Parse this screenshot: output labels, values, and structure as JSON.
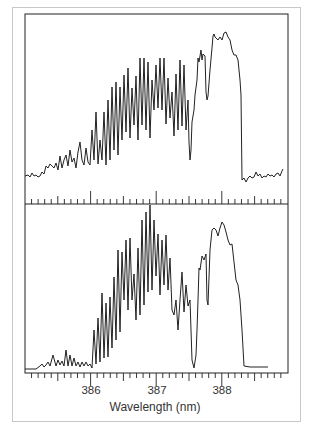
{
  "chart_data": {
    "type": "line",
    "title": "",
    "xlabel": "Wavelength (nm)",
    "ylabel": "",
    "xlim": [
      385.0,
      389.0
    ],
    "x_ticks_major": [
      386,
      387,
      388
    ],
    "x_tick_labels": [
      "386",
      "387",
      "388"
    ],
    "minor_tick_step": 0.1,
    "grid": false,
    "legend": null,
    "panels": [
      {
        "name": "top-spectrum",
        "description": "Measured/noisy emission spectrum with rotational band structure",
        "x": [
          385.0,
          385.3,
          385.5,
          385.7,
          385.9,
          386.0,
          386.1,
          386.2,
          386.3,
          386.4,
          386.5,
          386.6,
          386.7,
          386.8,
          386.9,
          387.0,
          387.1,
          387.2,
          387.3,
          387.4,
          387.5,
          387.6,
          387.7,
          387.8,
          387.9,
          388.0,
          388.1,
          388.2,
          388.3,
          388.4,
          388.5,
          388.7,
          388.9
        ],
        "y": [
          0.1,
          0.12,
          0.18,
          0.22,
          0.28,
          0.4,
          0.55,
          0.65,
          0.72,
          0.8,
          0.85,
          0.9,
          0.92,
          0.9,
          0.85,
          0.78,
          0.7,
          0.6,
          0.55,
          0.15,
          0.4,
          0.75,
          0.7,
          0.92,
          0.95,
          0.97,
          0.9,
          0.6,
          0.1,
          0.08,
          0.1,
          0.12,
          0.14
        ]
      },
      {
        "name": "bottom-spectrum",
        "description": "Simulated spectrum",
        "x": [
          385.0,
          385.3,
          385.5,
          385.7,
          385.9,
          386.0,
          386.1,
          386.2,
          386.3,
          386.4,
          386.5,
          386.6,
          386.7,
          386.8,
          386.9,
          387.0,
          387.1,
          387.2,
          387.3,
          387.4,
          387.5,
          387.6,
          387.7,
          387.8,
          387.9,
          388.0,
          388.1,
          388.2,
          388.3,
          388.4,
          388.5,
          388.7,
          388.9
        ],
        "y": [
          0.0,
          0.03,
          0.1,
          0.14,
          0.1,
          0.05,
          0.35,
          0.45,
          0.55,
          0.62,
          0.72,
          0.8,
          0.85,
          0.88,
          0.85,
          0.75,
          0.68,
          0.55,
          0.45,
          0.02,
          0.35,
          0.62,
          0.55,
          0.92,
          0.95,
          0.97,
          0.85,
          0.6,
          0.02,
          0.02,
          0.02,
          null,
          null
        ]
      }
    ]
  }
}
